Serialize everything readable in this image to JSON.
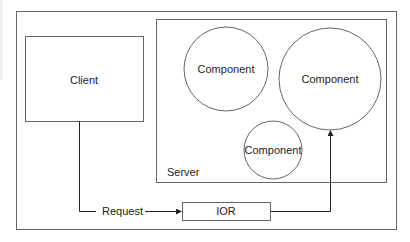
{
  "diagram": {
    "colors": {
      "stroke": "#555555",
      "arrow": "#222222",
      "text": "#222222",
      "background": "#ffffff"
    },
    "client": {
      "label": "Client"
    },
    "server": {
      "label": "Server",
      "components": [
        {
          "label": "Component"
        },
        {
          "label": "Component"
        },
        {
          "label": "Component"
        }
      ]
    },
    "request": {
      "label": "Request"
    },
    "ior": {
      "label": "IOR"
    }
  }
}
